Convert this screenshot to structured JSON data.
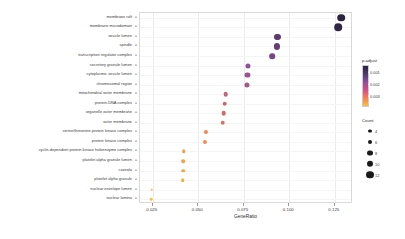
{
  "chart_data": {
    "type": "scatter",
    "title": "",
    "xlabel": "GeneRatio",
    "ylabel": "",
    "xlim": [
      0.018,
      0.135
    ],
    "xticks": [
      0.025,
      0.05,
      0.075,
      0.1,
      0.125
    ],
    "xtick_labels": [
      "0.025",
      "0.050",
      "0.075",
      "0.100",
      "0.125"
    ],
    "grid": true,
    "legend_position": "right",
    "categories": [
      "membrane raft",
      "membrane microdomain",
      "vesicle lumen",
      "spindle",
      "transcription regulator complex",
      "secretory granule lumen",
      "cytoplasmic vesicle lumen",
      "chromosomal region",
      "mitochondrial outer membrane",
      "protein-DNA complex",
      "organelle outer membrane",
      "outer membrane",
      "serine/threonine protein kinase complex",
      "protein kinase complex",
      "cyclin-dependent protein kinase holoenzyme complex",
      "platelet alpha granule lumen",
      "caveola",
      "platelet alpha granule",
      "nuclear envelope lumen",
      "nuclear lamina"
    ],
    "gene_ratio": [
      0.1285,
      0.127,
      0.0935,
      0.093,
      0.0905,
      0.0775,
      0.077,
      0.0765,
      0.065,
      0.0645,
      0.064,
      0.0635,
      0.054,
      0.0535,
      0.042,
      0.0418,
      0.0416,
      0.0414,
      0.0245,
      0.0243
    ],
    "count": [
      13,
      13,
      10,
      10,
      9,
      8,
      8,
      8,
      7,
      7,
      7,
      7,
      6,
      6,
      5,
      5,
      5,
      5,
      3,
      3
    ],
    "p_adjust": [
      0.0004,
      0.0005,
      0.001,
      0.0011,
      0.0013,
      0.0016,
      0.0017,
      0.0018,
      0.0021,
      0.0022,
      0.0023,
      0.0024,
      0.0028,
      0.0029,
      0.0032,
      0.0033,
      0.0034,
      0.0035,
      0.0038,
      0.0039
    ]
  },
  "legends": {
    "padjust": {
      "title": "p.adjust",
      "ticks": [
        "0.001",
        "0.002",
        "0.003"
      ],
      "tick_values": [
        0.001,
        0.002,
        0.003
      ],
      "vmin": 0.0004,
      "vmax": 0.0039,
      "colors": [
        "#2b2340",
        "#8e4f9e",
        "#f57f4f",
        "#f9c23c"
      ]
    },
    "count": {
      "title": "Count",
      "items": [
        {
          "label": "4",
          "size": 3.2
        },
        {
          "label": "6",
          "size": 4.2
        },
        {
          "label": "8",
          "size": 5.2
        },
        {
          "label": "10",
          "size": 6.4
        },
        {
          "label": "12",
          "size": 7.6
        }
      ]
    }
  },
  "style": {
    "panel_bg": "#ffffff",
    "grid_color": "#ececec",
    "axis_text_color": "#3a3a3a"
  }
}
